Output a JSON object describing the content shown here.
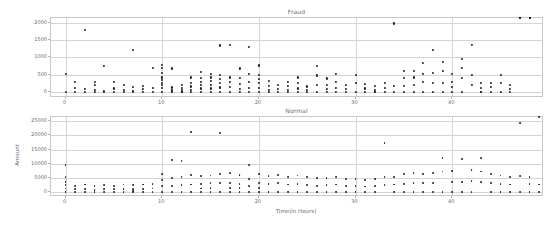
{
  "figure": {
    "width": 560,
    "height": 227,
    "background": "#ffffff",
    "marker_color": "#1f1f1f",
    "grid_color": "#d5d5d5",
    "frame_color": "#c8c8c8",
    "text_color": "#6a6a6a"
  },
  "chart_data": [
    {
      "type": "scatter",
      "title": "Fraud",
      "xlabel": "",
      "ylabel": "",
      "xlim": [
        -1.5,
        49.5
      ],
      "ylim": [
        -180,
        2150
      ],
      "xticks": [
        0,
        10,
        20,
        30,
        40
      ],
      "yticks": [
        0,
        500,
        1000,
        1500,
        2000
      ],
      "grid": true,
      "legend": "none",
      "x": [
        0,
        0,
        1,
        1,
        1,
        2,
        2,
        2,
        3,
        3,
        3,
        3,
        4,
        4,
        4,
        5,
        5,
        5,
        6,
        6,
        6,
        7,
        7,
        7,
        7,
        8,
        8,
        8,
        9,
        9,
        9,
        10,
        10,
        10,
        10,
        10,
        10,
        10,
        10,
        10,
        11,
        11,
        11,
        11,
        12,
        12,
        12,
        12,
        12,
        12,
        13,
        13,
        13,
        13,
        13,
        14,
        14,
        14,
        14,
        14,
        14,
        15,
        15,
        15,
        15,
        15,
        15,
        16,
        16,
        16,
        16,
        16,
        16,
        17,
        17,
        17,
        17,
        17,
        18,
        18,
        18,
        18,
        18,
        19,
        19,
        19,
        19,
        19,
        20,
        20,
        20,
        20,
        20,
        20,
        21,
        21,
        21,
        21,
        22,
        22,
        22,
        23,
        23,
        23,
        23,
        24,
        24,
        24,
        24,
        25,
        25,
        25,
        26,
        26,
        26,
        26,
        27,
        27,
        27,
        27,
        28,
        28,
        28,
        28,
        29,
        29,
        29,
        30,
        30,
        30,
        31,
        31,
        31,
        32,
        32,
        32,
        32,
        33,
        33,
        33,
        34,
        34,
        34,
        35,
        35,
        35,
        35,
        36,
        36,
        36,
        36,
        37,
        37,
        37,
        37,
        38,
        38,
        38,
        38,
        39,
        39,
        39,
        39,
        40,
        40,
        40,
        40,
        41,
        41,
        41,
        41,
        42,
        42,
        42,
        43,
        43,
        43,
        43,
        44,
        44,
        44,
        45,
        45,
        45,
        46,
        46,
        46,
        47,
        47,
        47,
        48,
        48,
        48
      ],
      "y": [
        520,
        0,
        300,
        120,
        0,
        1800,
        90,
        0,
        280,
        200,
        60,
        0,
        760,
        30,
        0,
        280,
        100,
        0,
        210,
        60,
        0,
        1210,
        150,
        20,
        0,
        180,
        80,
        0,
        700,
        120,
        0,
        790,
        700,
        560,
        420,
        340,
        260,
        190,
        120,
        0,
        680,
        130,
        40,
        0,
        200,
        120,
        60,
        0,
        0,
        0,
        420,
        270,
        160,
        60,
        0,
        580,
        400,
        300,
        200,
        100,
        0,
        520,
        420,
        320,
        200,
        100,
        0,
        1350,
        500,
        380,
        250,
        130,
        0,
        1360,
        420,
        300,
        150,
        0,
        680,
        400,
        220,
        90,
        0,
        1300,
        520,
        300,
        120,
        0,
        770,
        500,
        380,
        260,
        120,
        0,
        320,
        180,
        60,
        0,
        200,
        90,
        0,
        300,
        180,
        60,
        0,
        420,
        250,
        100,
        0,
        160,
        60,
        0,
        760,
        480,
        200,
        0,
        390,
        200,
        80,
        0,
        520,
        300,
        120,
        0,
        200,
        90,
        0,
        500,
        260,
        0,
        240,
        100,
        0,
        180,
        60,
        0,
        0,
        270,
        120,
        0,
        1990,
        180,
        0,
        600,
        400,
        180,
        0,
        620,
        420,
        200,
        0,
        840,
        520,
        300,
        0,
        1230,
        560,
        260,
        0,
        880,
        620,
        260,
        0,
        530,
        300,
        150,
        0,
        970,
        700,
        400,
        0,
        1360,
        500,
        200,
        0,
        260,
        120,
        0,
        270,
        140,
        0,
        500,
        250,
        0,
        200,
        90,
        0
      ]
    },
    {
      "type": "scatter",
      "title": "Normal",
      "xlabel": "Time(in Hours)",
      "ylabel": "Amount",
      "xlim": [
        -1.5,
        49.5
      ],
      "ylim": [
        -1800,
        26500
      ],
      "xticks": [
        0,
        10,
        20,
        30,
        40
      ],
      "yticks": [
        0,
        5000,
        10000,
        15000,
        20000,
        25000
      ],
      "grid": true,
      "legend": "none",
      "x": [
        0,
        0,
        0,
        0,
        0,
        0,
        1,
        1,
        1,
        2,
        2,
        2,
        3,
        3,
        3,
        4,
        4,
        4,
        5,
        5,
        5,
        6,
        6,
        6,
        7,
        7,
        7,
        7,
        8,
        8,
        8,
        9,
        9,
        9,
        10,
        10,
        10,
        10,
        11,
        11,
        11,
        11,
        12,
        12,
        12,
        12,
        13,
        13,
        13,
        13,
        14,
        14,
        14,
        14,
        15,
        15,
        15,
        15,
        16,
        16,
        16,
        16,
        17,
        17,
        17,
        17,
        18,
        18,
        18,
        18,
        19,
        19,
        19,
        19,
        20,
        20,
        20,
        20,
        21,
        21,
        21,
        22,
        22,
        22,
        23,
        23,
        23,
        24,
        24,
        24,
        25,
        25,
        25,
        26,
        26,
        26,
        27,
        27,
        27,
        28,
        28,
        28,
        29,
        29,
        29,
        30,
        30,
        30,
        31,
        31,
        31,
        32,
        32,
        32,
        33,
        33,
        33,
        34,
        34,
        34,
        35,
        35,
        35,
        36,
        36,
        36,
        37,
        37,
        37,
        38,
        38,
        38,
        39,
        39,
        39,
        40,
        40,
        40,
        41,
        41,
        41,
        42,
        42,
        42,
        43,
        43,
        43,
        44,
        44,
        44,
        45,
        45,
        45,
        46,
        46,
        46,
        47,
        47,
        47,
        48,
        48,
        48,
        49,
        49,
        49
      ],
      "y": [
        9600,
        5200,
        3600,
        2400,
        1200,
        0,
        2200,
        900,
        0,
        2600,
        1100,
        0,
        2000,
        800,
        0,
        2400,
        1000,
        0,
        2200,
        900,
        0,
        2600,
        1100,
        0,
        2400,
        1000,
        400,
        0,
        2600,
        1100,
        0,
        2800,
        1200,
        0,
        6200,
        4200,
        2000,
        0,
        11400,
        5000,
        2200,
        0,
        11000,
        5200,
        2400,
        0,
        21200,
        6000,
        2600,
        0,
        5600,
        2800,
        1200,
        0,
        5800,
        3000,
        1400,
        0,
        20700,
        6400,
        3000,
        0,
        6600,
        3200,
        1500,
        0,
        6000,
        2800,
        1300,
        0,
        9400,
        4600,
        2200,
        0,
        6200,
        3000,
        1400,
        0,
        5600,
        2800,
        0,
        6000,
        3000,
        0,
        5400,
        2600,
        0,
        5800,
        2800,
        0,
        5200,
        2400,
        0,
        4800,
        2200,
        0,
        5000,
        2400,
        0,
        5200,
        2600,
        0,
        4600,
        2200,
        0,
        4400,
        2000,
        0,
        4200,
        1900,
        0,
        4600,
        2100,
        0,
        17200,
        5200,
        2400,
        0,
        5400,
        2600,
        0,
        6200,
        2800,
        0,
        6800,
        3200,
        0,
        6400,
        3000,
        0,
        6600,
        3100,
        0,
        12100,
        7200,
        3400,
        0,
        7400,
        3600,
        0,
        11600,
        7600,
        3800,
        0,
        11900,
        7200,
        3400,
        0,
        6400,
        3000,
        0,
        5800,
        2800,
        0,
        5400,
        2600,
        0,
        24300,
        5600,
        2700,
        0,
        5200,
        2600,
        0
      ]
    }
  ]
}
